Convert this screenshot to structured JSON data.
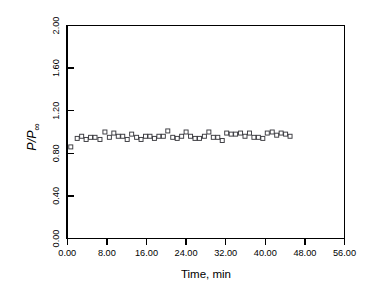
{
  "chart_data": {
    "type": "scatter",
    "title": "",
    "xlabel": "Time, min",
    "ylabel": "P/P∞",
    "ylabel_parts": {
      "numerator": "P",
      "separator": "/",
      "denominator": "P",
      "subscript": "∞"
    },
    "xlim": [
      0,
      56
    ],
    "ylim": [
      0,
      2.0
    ],
    "xticks": [
      0,
      8,
      16,
      24,
      32,
      40,
      48,
      56
    ],
    "xtick_labels": [
      "0.00",
      "8.00",
      "16.00",
      "24.00",
      "32.00",
      "40.00",
      "48.00",
      "56.00"
    ],
    "yticks": [
      0,
      0.4,
      0.8,
      1.2,
      1.6,
      2.0
    ],
    "ytick_labels": [
      "0.00",
      "0.40",
      "0.80",
      "1.20",
      "1.60",
      "2.00"
    ],
    "grid": false,
    "legend": null,
    "marker": "open-square",
    "marker_color": "#3a3a3f",
    "marker_size": 4,
    "series": [
      {
        "name": "P/P∞ vs time",
        "x": [
          0.7,
          2.0,
          2.9,
          3.8,
          4.7,
          5.6,
          6.6,
          7.6,
          8.5,
          9.4,
          10.3,
          11.2,
          12.1,
          13.0,
          14.0,
          14.9,
          15.8,
          16.7,
          17.6,
          18.5,
          19.4,
          20.3,
          21.3,
          22.2,
          23.1,
          24.0,
          24.9,
          25.8,
          26.7,
          27.7,
          28.6,
          29.5,
          30.4,
          31.3,
          32.2,
          33.1,
          34.0,
          35.0,
          35.9,
          36.8,
          37.7,
          38.6,
          39.5,
          40.4,
          41.4,
          42.3,
          43.2,
          44.1,
          45.0
        ],
        "y": [
          0.86,
          0.94,
          0.96,
          0.93,
          0.95,
          0.95,
          0.93,
          1.0,
          0.95,
          0.99,
          0.96,
          0.96,
          0.93,
          0.98,
          0.95,
          0.93,
          0.96,
          0.96,
          0.94,
          0.96,
          0.96,
          1.01,
          0.95,
          0.94,
          0.96,
          1.0,
          0.96,
          0.94,
          0.94,
          0.96,
          1.0,
          0.95,
          0.95,
          0.92,
          0.99,
          0.98,
          0.98,
          0.99,
          0.96,
          0.99,
          0.95,
          0.95,
          0.94,
          0.99,
          1.0,
          0.97,
          0.99,
          0.98,
          0.96
        ]
      }
    ]
  },
  "axes": {
    "x_axis_title": "Time, min",
    "y_axis_title": "P/P∞"
  }
}
